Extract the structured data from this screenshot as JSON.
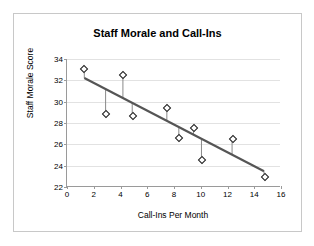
{
  "chart_data": {
    "type": "scatter",
    "title": "Staff Morale and Call-Ins",
    "xlabel": "Call-Ins Per Month",
    "ylabel": "Staff Morale Score",
    "xlim": [
      0,
      16
    ],
    "ylim": [
      22,
      34
    ],
    "xticks": [
      0,
      2,
      4,
      6,
      8,
      10,
      12,
      14,
      16
    ],
    "yticks": [
      22,
      24,
      26,
      28,
      30,
      32,
      34
    ],
    "grid": "horizontal",
    "legend": "none",
    "series": [
      {
        "name": "Staff Morale Score",
        "marker": "diamond",
        "x": [
          1.3,
          2.9,
          4.2,
          4.9,
          7.5,
          8.4,
          9.5,
          10.1,
          12.4,
          14.8
        ],
        "y": [
          33.1,
          28.8,
          32.5,
          28.7,
          29.4,
          26.6,
          27.5,
          24.5,
          26.5,
          22.9
        ]
      }
    ],
    "trendline": {
      "name": "Linear fit",
      "x": [
        1.3,
        14.8
      ],
      "y": [
        32.2,
        23.4
      ],
      "color": "#555555",
      "residuals_shown": true
    },
    "annotations": []
  },
  "colors": {
    "frame_border": "#c8c8c8",
    "axis": "#9a9a9a",
    "gridline": "#e2e2e2",
    "marker_stroke": "#1a1a1a",
    "marker_fill": "#ffffff",
    "trendline": "#555555",
    "residual": "#888888",
    "text": "#000000",
    "background": "#ffffff"
  }
}
